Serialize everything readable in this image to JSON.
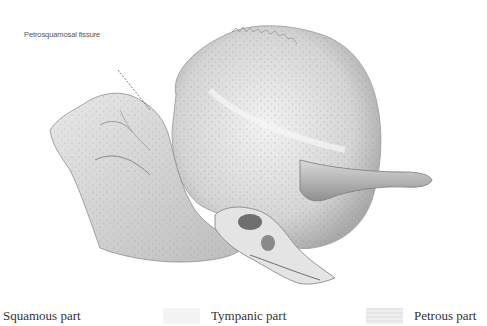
{
  "figure": {
    "annotation": "Petrosquamosal fissure"
  },
  "legend": {
    "items": [
      {
        "label": "Squamous part",
        "swatch_color": "#ffffff"
      },
      {
        "label": "Tympanic part",
        "swatch_color": "#f3f3f3"
      },
      {
        "label": "Petrous part",
        "swatch_color": "#e6e6e6"
      }
    ]
  }
}
